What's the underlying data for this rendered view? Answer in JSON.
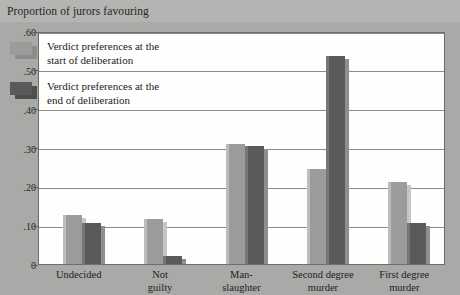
{
  "chart_data": {
    "type": "bar",
    "title": "Proportion of jurors favouring",
    "xlabel": "",
    "ylabel": "",
    "ylim": [
      0,
      0.6
    ],
    "ytick_labels": [
      ".60",
      ".50",
      ".40",
      ".30",
      ".20",
      ".10",
      "0"
    ],
    "ytick_values": [
      0.6,
      0.5,
      0.4,
      0.3,
      0.2,
      0.1,
      0
    ],
    "grid": true,
    "legend_position": "upper-left-inside",
    "categories": [
      "Undecided",
      "Not guilty",
      "Man-slaughter",
      "Second degree murder",
      "First degree murder"
    ],
    "category_lines": [
      [
        "Undecided"
      ],
      [
        "Not",
        "guilty"
      ],
      [
        "Man-",
        "slaughter"
      ],
      [
        "Second degree",
        "murder"
      ],
      [
        "First degree",
        "murder"
      ]
    ],
    "series": [
      {
        "name": "Verdict preferences at the start of deliberation",
        "name_lines": [
          "Verdict preferences at the",
          "start of deliberation"
        ],
        "color": "#9b9b99",
        "values": [
          0.125,
          0.115,
          0.31,
          0.245,
          0.21
        ]
      },
      {
        "name": "Verdict preferences at the end of deliberation",
        "name_lines": [
          "Verdict preferences at the",
          "end of deliberation"
        ],
        "color": "#5a5a58",
        "values": [
          0.105,
          0.02,
          0.305,
          0.535,
          0.105
        ]
      }
    ]
  },
  "colors": {
    "background": "#a9a9a7",
    "title_banner": "#b4b4b2",
    "plot_background": "#fefefd",
    "gridline": "#8a8a88",
    "series_start": "#9b9b99",
    "series_end": "#5a5a58",
    "text": "#23211d"
  }
}
